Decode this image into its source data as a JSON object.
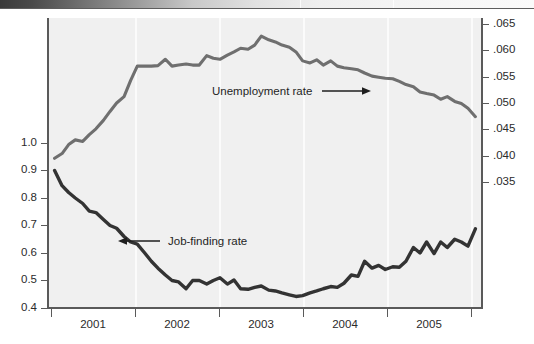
{
  "figure": {
    "background_color": "#f0f0f0",
    "plot_area": {
      "left": 48,
      "top": 18,
      "width": 434,
      "height": 290
    }
  },
  "annotations": {
    "unemployment_label": "Unemployment rate",
    "jobfinding_label": "Job-finding rate"
  },
  "colors": {
    "unemployment_line": "#6f6f6f",
    "jobfinding_line": "#333333",
    "axis": "#5a5a5a",
    "plot_bg": "#f0f0f0",
    "gridline": "#fbfbfb",
    "text": "#2b2b2b"
  },
  "axes": {
    "left_ticks": [
      "1.0",
      "0.9",
      "0.8",
      "0.7",
      "0.6",
      "0.5",
      "0.4"
    ],
    "right_ticks": [
      ".065",
      ".060",
      ".055",
      ".050",
      ".045",
      ".040",
      ".035"
    ],
    "x_ticks": [
      "2001",
      "2002",
      "2003",
      "2004",
      "2005"
    ]
  },
  "chart_data": {
    "type": "line",
    "title": "",
    "subtitle": "",
    "xlabel": "",
    "ylabel": "",
    "y2label": "",
    "grid": true,
    "legend_position": "inline-annotations",
    "xlim": [
      2000.5,
      2005.75
    ],
    "ylim": [
      0.4,
      1.05
    ],
    "y2lim": [
      0.0325,
      0.066
    ],
    "x_tick_labels": [
      "2001",
      "2002",
      "2003",
      "2004",
      "2005"
    ],
    "x_tick_values": [
      2001,
      2002,
      2003,
      2004,
      2005
    ],
    "left_axis_tick_labels": [
      "0.4",
      "0.5",
      "0.6",
      "0.7",
      "0.8",
      "0.9",
      "1.0"
    ],
    "left_axis_tick_values": [
      0.4,
      0.5,
      0.6,
      0.7,
      0.8,
      0.9,
      1.0
    ],
    "right_axis_tick_labels": [
      ".035",
      ".040",
      ".045",
      ".050",
      ".055",
      ".060",
      ".065"
    ],
    "right_axis_tick_values": [
      0.035,
      0.04,
      0.045,
      0.05,
      0.055,
      0.06,
      0.065
    ],
    "series": [
      {
        "name": "Unemployment rate",
        "axis": "right",
        "color": "#6f6f6f",
        "x": [
          2000.58,
          2000.67,
          2000.75,
          2000.83,
          2000.92,
          2001.0,
          2001.08,
          2001.17,
          2001.25,
          2001.33,
          2001.42,
          2001.5,
          2001.58,
          2001.67,
          2001.75,
          2001.83,
          2001.92,
          2002.0,
          2002.08,
          2002.17,
          2002.25,
          2002.33,
          2002.42,
          2002.5,
          2002.58,
          2002.67,
          2002.75,
          2002.83,
          2002.92,
          2003.0,
          2003.08,
          2003.17,
          2003.25,
          2003.33,
          2003.42,
          2003.5,
          2003.58,
          2003.67,
          2003.75,
          2003.83,
          2003.92,
          2004.0,
          2004.08,
          2004.17,
          2004.25,
          2004.33,
          2004.42,
          2004.5,
          2004.58,
          2004.67,
          2004.75,
          2004.83,
          2004.92,
          2005.0,
          2005.08,
          2005.17,
          2005.25,
          2005.33,
          2005.42,
          2005.5,
          2005.58,
          2005.67
        ],
        "y": [
          0.0395,
          0.0404,
          0.0421,
          0.043,
          0.0427,
          0.044,
          0.0451,
          0.0467,
          0.0484,
          0.05,
          0.0512,
          0.0543,
          0.057,
          0.057,
          0.057,
          0.0571,
          0.0583,
          0.057,
          0.0572,
          0.0574,
          0.0572,
          0.0572,
          0.059,
          0.0585,
          0.0583,
          0.0591,
          0.0597,
          0.0604,
          0.0602,
          0.061,
          0.0627,
          0.062,
          0.0616,
          0.061,
          0.0606,
          0.0597,
          0.058,
          0.0576,
          0.0582,
          0.0572,
          0.058,
          0.057,
          0.0567,
          0.0565,
          0.0563,
          0.0557,
          0.0551,
          0.0549,
          0.0547,
          0.0546,
          0.0541,
          0.0535,
          0.0531,
          0.0521,
          0.0518,
          0.0515,
          0.0507,
          0.0512,
          0.0503,
          0.0499,
          0.049,
          0.0474
        ]
      },
      {
        "name": "Job-finding rate",
        "axis": "left",
        "color": "#333333",
        "x": [
          2000.58,
          2000.67,
          2000.75,
          2000.83,
          2000.92,
          2001.0,
          2001.08,
          2001.17,
          2001.25,
          2001.33,
          2001.42,
          2001.5,
          2001.58,
          2001.67,
          2001.75,
          2001.83,
          2001.92,
          2002.0,
          2002.08,
          2002.17,
          2002.25,
          2002.33,
          2002.42,
          2002.5,
          2002.58,
          2002.67,
          2002.75,
          2002.83,
          2002.92,
          2003.0,
          2003.08,
          2003.17,
          2003.25,
          2003.33,
          2003.42,
          2003.5,
          2003.58,
          2003.67,
          2003.75,
          2003.83,
          2003.92,
          2004.0,
          2004.08,
          2004.17,
          2004.25,
          2004.33,
          2004.42,
          2004.5,
          2004.58,
          2004.67,
          2004.75,
          2004.83,
          2004.92,
          2005.0,
          2005.08,
          2005.17,
          2005.25,
          2005.33,
          2005.42,
          2005.5,
          2005.58,
          2005.67
        ],
        "y": [
          0.9,
          0.845,
          0.82,
          0.8,
          0.78,
          0.752,
          0.747,
          0.722,
          0.7,
          0.69,
          0.66,
          0.64,
          0.632,
          0.6,
          0.57,
          0.545,
          0.52,
          0.5,
          0.495,
          0.47,
          0.5,
          0.5,
          0.487,
          0.5,
          0.51,
          0.487,
          0.502,
          0.47,
          0.468,
          0.475,
          0.48,
          0.465,
          0.462,
          0.455,
          0.448,
          0.442,
          0.445,
          0.455,
          0.462,
          0.47,
          0.478,
          0.475,
          0.49,
          0.52,
          0.515,
          0.57,
          0.545,
          0.555,
          0.54,
          0.55,
          0.548,
          0.57,
          0.62,
          0.6,
          0.64,
          0.598,
          0.64,
          0.62,
          0.65,
          0.64,
          0.625,
          0.688
        ]
      }
    ]
  }
}
